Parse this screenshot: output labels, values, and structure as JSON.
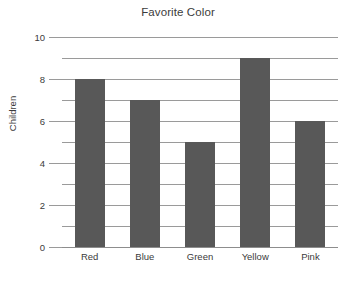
{
  "chart_data": {
    "type": "bar",
    "title": "Favorite Color",
    "xlabel": "",
    "ylabel": "Children",
    "categories": [
      "Red",
      "Blue",
      "Green",
      "Yellow",
      "Pink"
    ],
    "values": [
      8,
      7,
      5,
      9,
      6
    ],
    "ylim": [
      0,
      10
    ],
    "ytick_labels": [
      "0",
      "2",
      "4",
      "6",
      "8",
      "10"
    ],
    "ytick_values": [
      0,
      2,
      4,
      6,
      8,
      10
    ],
    "gridline_values": [
      0,
      1,
      2,
      3,
      4,
      5,
      6,
      7,
      8,
      9,
      10
    ],
    "grid": true,
    "legend": "none",
    "bar_color": "#585858",
    "grid_color": "#9a9a9a",
    "background_color": "#ffffff",
    "text_color": "#3b3b3b"
  }
}
